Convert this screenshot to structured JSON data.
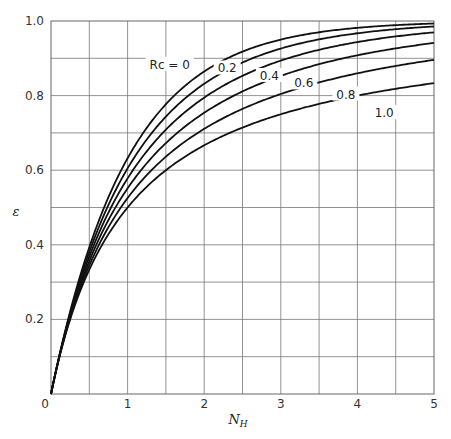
{
  "chart_data": {
    "type": "line",
    "title": "",
    "xlabel": "N_H",
    "ylabel": "ε",
    "xlim": [
      0,
      5
    ],
    "ylim": [
      0,
      1.0
    ],
    "grid": true,
    "x_ticks": [
      "0",
      "1",
      "2",
      "3",
      "4",
      "5"
    ],
    "y_ticks": [
      "0",
      "0.2",
      "0.4",
      "0.6",
      "0.8",
      "1.0"
    ],
    "legend_prefix": "Rc = ",
    "x": [
      0,
      0.25,
      0.5,
      0.75,
      1.0,
      1.5,
      2.0,
      2.5,
      3.0,
      3.5,
      4.0,
      4.5,
      5.0
    ],
    "series": [
      {
        "name": "Rc = 0",
        "label": "Rc = 0",
        "R": 0.0,
        "values": [
          0,
          0.221,
          0.393,
          0.528,
          0.632,
          0.777,
          0.865,
          0.918,
          0.95,
          0.97,
          0.982,
          0.989,
          0.993
        ]
      },
      {
        "name": "Rc = 0.2",
        "label": "0.2",
        "R": 0.2,
        "values": [
          0,
          0.216,
          0.378,
          0.503,
          0.6,
          0.742,
          0.834,
          0.893,
          0.931,
          0.956,
          0.972,
          0.982,
          0.983
        ]
      },
      {
        "name": "Rc = 0.4",
        "label": "0.4",
        "R": 0.4,
        "values": [
          0,
          0.212,
          0.365,
          0.48,
          0.57,
          0.703,
          0.795,
          0.858,
          0.903,
          0.933,
          0.954,
          0.968,
          0.97
        ]
      },
      {
        "name": "Rc = 0.6",
        "label": "0.6",
        "R": 0.6,
        "values": [
          0,
          0.207,
          0.352,
          0.459,
          0.541,
          0.663,
          0.75,
          0.813,
          0.86,
          0.895,
          0.92,
          0.939,
          0.94
        ]
      },
      {
        "name": "Rc = 0.8",
        "label": "0.8",
        "R": 0.8,
        "values": [
          0,
          0.203,
          0.34,
          0.439,
          0.514,
          0.624,
          0.703,
          0.763,
          0.808,
          0.843,
          0.871,
          0.893,
          0.9
        ]
      },
      {
        "name": "Rc = 1.0",
        "label": "1.0",
        "R": 1.0,
        "values": [
          0,
          0.2,
          0.333,
          0.429,
          0.5,
          0.6,
          0.667,
          0.714,
          0.75,
          0.778,
          0.8,
          0.818,
          0.833
        ]
      }
    ],
    "annotations": [
      {
        "text": "Rc = 0",
        "x": 1.55,
        "y": 0.88
      },
      {
        "text": "0.2",
        "x": 2.3,
        "y": 0.87
      },
      {
        "text": "0.4",
        "x": 2.85,
        "y": 0.85
      },
      {
        "text": "0.6",
        "x": 3.3,
        "y": 0.83
      },
      {
        "text": "0.8",
        "x": 3.85,
        "y": 0.8
      },
      {
        "text": "1.0",
        "x": 4.35,
        "y": 0.75
      }
    ]
  }
}
